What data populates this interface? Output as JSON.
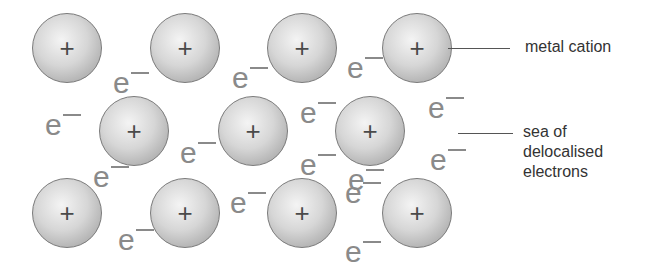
{
  "diagram": {
    "cation_symbol": "+",
    "electron_symbol": "e",
    "cations": [
      {
        "x": 32,
        "y": 13
      },
      {
        "x": 150,
        "y": 13
      },
      {
        "x": 267,
        "y": 13
      },
      {
        "x": 382,
        "y": 13
      },
      {
        "x": 99,
        "y": 96
      },
      {
        "x": 218,
        "y": 96
      },
      {
        "x": 335,
        "y": 96
      },
      {
        "x": 32,
        "y": 178
      },
      {
        "x": 150,
        "y": 178
      },
      {
        "x": 267,
        "y": 178
      },
      {
        "x": 382,
        "y": 178
      }
    ],
    "electrons": [
      {
        "x": 113,
        "y": 68
      },
      {
        "x": 232,
        "y": 63
      },
      {
        "x": 347,
        "y": 53
      },
      {
        "x": 45,
        "y": 110
      },
      {
        "x": 180,
        "y": 138
      },
      {
        "x": 300,
        "y": 98
      },
      {
        "x": 428,
        "y": 93
      },
      {
        "x": 93,
        "y": 162
      },
      {
        "x": 300,
        "y": 150
      },
      {
        "x": 348,
        "y": 165
      },
      {
        "x": 430,
        "y": 145
      },
      {
        "x": 118,
        "y": 225
      },
      {
        "x": 230,
        "y": 188
      },
      {
        "x": 345,
        "y": 178
      },
      {
        "x": 345,
        "y": 237
      }
    ],
    "labels": {
      "cation_label": "metal cation",
      "sea_label_line1": "sea of",
      "sea_label_line2": "delocalised",
      "sea_label_line3": "electrons"
    }
  }
}
